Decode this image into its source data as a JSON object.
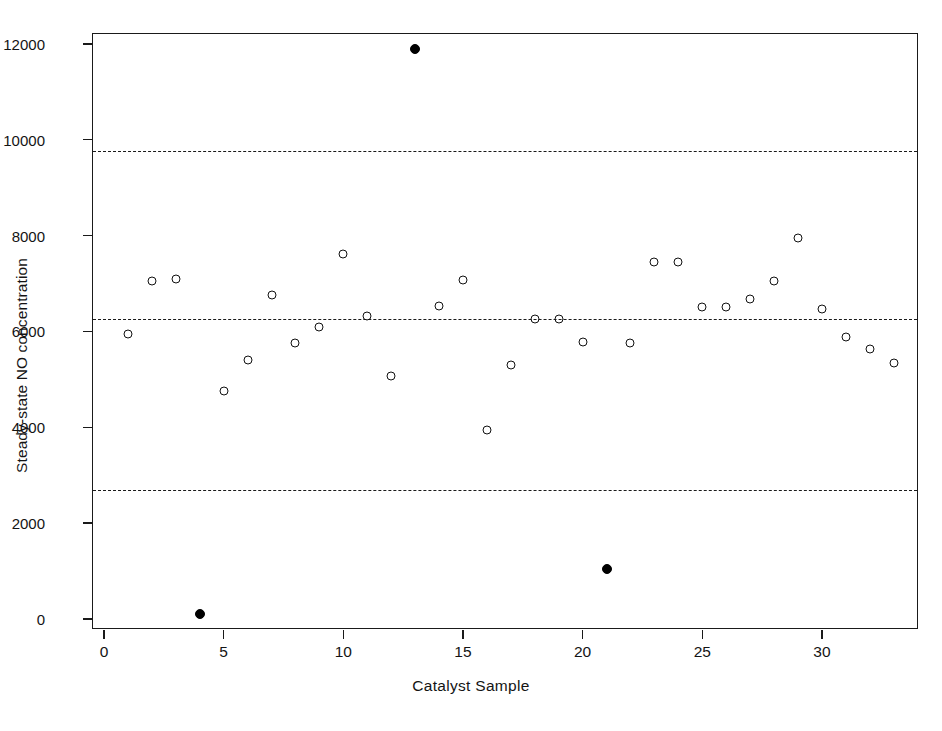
{
  "chart_data": {
    "type": "scatter",
    "title": "",
    "xlabel": "Catalyst Sample",
    "ylabel": "Steady-state NO concentration",
    "xlim": [
      -0.45,
      34.1
    ],
    "ylim": [
      -500,
      12420
    ],
    "xticks": [
      0,
      5,
      10,
      15,
      20,
      25,
      30
    ],
    "yticks": [
      0,
      2000,
      4000,
      6000,
      8000,
      10000,
      12000
    ],
    "xticklabels": [
      "0",
      "5",
      "10",
      "15",
      "20",
      "25",
      "30"
    ],
    "yticklabels": [
      "0",
      "2000",
      "4000",
      "6000",
      "8000",
      "10000",
      "12000"
    ],
    "grid": false,
    "legend": null,
    "marker_open": "open-circle",
    "marker_filled": "filled-circle",
    "reference_lines": [
      {
        "name": "upper-control-limit",
        "value": 9760,
        "style": "dashed"
      },
      {
        "name": "center-line",
        "value": 6250,
        "style": "dashed"
      },
      {
        "name": "lower-control-limit",
        "value": 2700,
        "style": "dashed"
      }
    ],
    "x": [
      1,
      2,
      3,
      4,
      5,
      6,
      7,
      8,
      9,
      10,
      11,
      12,
      13,
      14,
      15,
      16,
      17,
      18,
      19,
      20,
      21,
      22,
      23,
      24,
      25,
      26,
      27,
      28,
      29,
      30,
      31,
      32,
      33
    ],
    "values": [
      5950,
      7060,
      7100,
      100,
      4750,
      5400,
      6760,
      5760,
      6100,
      7620,
      6320,
      5080,
      11900,
      6540,
      7070,
      3950,
      5310,
      6250,
      6250,
      5770,
      1050,
      5750,
      7440,
      7440,
      6520,
      6520,
      6670,
      7060,
      7960,
      6470,
      5880,
      5640,
      5340
    ],
    "point_types": [
      "open",
      "open",
      "open",
      "filled",
      "open",
      "open",
      "open",
      "open",
      "open",
      "open",
      "open",
      "open",
      "filled",
      "open",
      "open",
      "open",
      "open",
      "open",
      "open",
      "open",
      "filled",
      "open",
      "open",
      "open",
      "open",
      "open",
      "open",
      "open",
      "open",
      "open",
      "open",
      "open",
      "open"
    ],
    "colors": {
      "axis": "#1a1a1a",
      "open_marker_edge": "#111111",
      "filled_marker": "#000000",
      "reference_line": "#1a1a1a",
      "background": "#ffffff"
    }
  }
}
